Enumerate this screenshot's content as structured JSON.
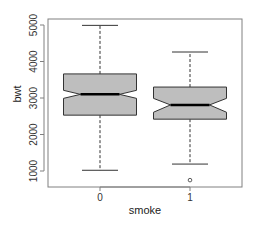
{
  "chart_data": {
    "type": "boxplot",
    "title": "",
    "xlabel": "smoke",
    "ylabel": "bwt",
    "categories": [
      "0",
      "1"
    ],
    "notched": true,
    "yticks": [
      1000,
      2000,
      3000,
      4000,
      5000
    ],
    "ylim": [
      600,
      5100
    ],
    "boxes": [
      {
        "category": "0",
        "whisker_low": 1020,
        "q1": 2530,
        "median": 3100,
        "q3": 3660,
        "whisker_high": 4990,
        "notch_low": 2990,
        "notch_high": 3210,
        "outliers": []
      },
      {
        "category": "1",
        "whisker_low": 1190,
        "q1": 2420,
        "median": 2810,
        "q3": 3300,
        "whisker_high": 4260,
        "notch_low": 2610,
        "notch_high": 2990,
        "outliers": [
          750
        ]
      }
    ],
    "colors": {
      "box_fill": "#bebebe",
      "box_border": "#333333",
      "median": "#000000",
      "frame": "#808080"
    },
    "grid": false,
    "legend": null
  }
}
